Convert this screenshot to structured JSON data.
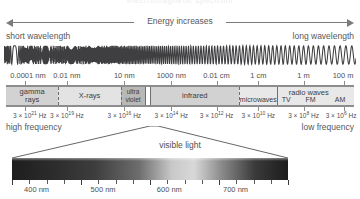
{
  "clipped_top_text": "electromagnetic spectrum",
  "energy_arrow": {
    "label": "Energy increases",
    "left_arrow_icon": "arrow-left-icon",
    "right_arrow_icon": "arrow-right-icon"
  },
  "wavelength_captions": {
    "short": "short wavelength",
    "long": "long wavelength"
  },
  "wave_graphic": {
    "icon": "sine-wave-icon",
    "description": "sine wave increasing in wavelength from left to right"
  },
  "wavelength_scale": {
    "ticks": [
      {
        "label": "0.0001 nm",
        "pos": 5.5
      },
      {
        "label": "0.01 nm",
        "pos": 17.5
      },
      {
        "label": "10 nm",
        "pos": 34.0
      },
      {
        "label": "1000 nm",
        "pos": 47.5
      },
      {
        "label": "0.01 cm",
        "pos": 60.5
      },
      {
        "label": "1 cm",
        "pos": 72.5
      },
      {
        "label": "1 m",
        "pos": 85.5
      },
      {
        "label": "100 m",
        "pos": 97.0
      }
    ]
  },
  "bands": [
    {
      "name": "gamma-rays",
      "label": "gamma\nrays",
      "start": 0.0,
      "end": 15.0,
      "shade": "#d2d2d2"
    },
    {
      "name": "x-rays",
      "label": "X-rays",
      "start": 15.0,
      "end": 33.0,
      "shade": "#e3e3e3"
    },
    {
      "name": "ultraviolet",
      "label": "ultra\nviolet",
      "start": 33.0,
      "end": 40.0,
      "shade": "#b8b8b8"
    },
    {
      "name": "infrared",
      "label": "infrared",
      "start": 41.5,
      "end": 67.0,
      "shade": "#d2d2d2"
    },
    {
      "name": "microwaves",
      "label": "microwaves",
      "start": 67.0,
      "end": 78.0,
      "shade": "#e8e8e8"
    },
    {
      "name": "radio-waves",
      "label": "radio waves",
      "start": 78.0,
      "end": 100.0,
      "shade": "#e8e8e8"
    }
  ],
  "radio_sublabels": [
    {
      "label": "TV",
      "pos": 80.5
    },
    {
      "label": "FM",
      "pos": 87.5
    },
    {
      "label": "AM",
      "pos": 96.0
    }
  ],
  "radio_group_label": "radio waves",
  "frequency_scale": {
    "ticks": [
      {
        "base": "3 × 10",
        "exp": "21",
        "unit": " Hz",
        "pos": 5.5
      },
      {
        "base": "3 × 10",
        "exp": "19",
        "unit": " Hz",
        "pos": 17.5
      },
      {
        "base": "3 × 10",
        "exp": "16",
        "unit": " Hz",
        "pos": 34.0
      },
      {
        "base": "3 × 10",
        "exp": "14",
        "unit": " Hz",
        "pos": 47.5
      },
      {
        "base": "3 × 10",
        "exp": "12",
        "unit": " Hz",
        "pos": 60.5
      },
      {
        "base": "3 × 10",
        "exp": "10",
        "unit": " Hz",
        "pos": 72.5
      },
      {
        "base": "3 × 10",
        "exp": "8",
        "unit": " Hz",
        "pos": 85.5
      },
      {
        "base": "3 × 10",
        "exp": "6",
        "unit": " Hz",
        "pos": 97.0
      }
    ]
  },
  "frequency_captions": {
    "high": "high frequency",
    "low": "low frequency"
  },
  "visible_light": {
    "title": "visible light",
    "callout_icon": "callout-lines-icon",
    "labels": [
      {
        "label": "400 nm",
        "pos": 8.0
      },
      {
        "label": "500 nm",
        "pos": 33.0
      },
      {
        "label": "600 nm",
        "pos": 57.0
      },
      {
        "label": "700 nm",
        "pos": 81.0
      }
    ],
    "tick_count": 17,
    "gradient_stops": [
      {
        "pos": 0,
        "color": "#1e1e1e"
      },
      {
        "pos": 14,
        "color": "#2b2b2b"
      },
      {
        "pos": 30,
        "color": "#3d3d3d"
      },
      {
        "pos": 46,
        "color": "#6d6d6d"
      },
      {
        "pos": 58,
        "color": "#c9c9c9"
      },
      {
        "pos": 66,
        "color": "#d8d8d8"
      },
      {
        "pos": 76,
        "color": "#8a8a8a"
      },
      {
        "pos": 88,
        "color": "#3a3a3a"
      },
      {
        "pos": 100,
        "color": "#1c1c1c"
      }
    ]
  },
  "colors": {
    "ink": "#4a4a4a",
    "rule": "#8d8d8d",
    "background": "#ffffff"
  }
}
